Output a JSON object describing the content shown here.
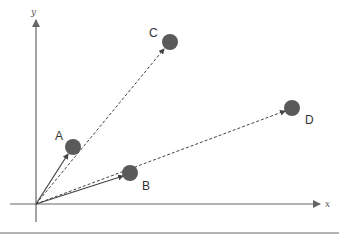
{
  "diagram": {
    "axes": {
      "x_label": "x",
      "y_label": "y",
      "color": "#666666"
    },
    "points": [
      {
        "label": "A",
        "vector": "solid"
      },
      {
        "label": "B",
        "vector": "solid"
      },
      {
        "label": "C",
        "vector": "dashed"
      },
      {
        "label": "D",
        "vector": "dashed"
      }
    ],
    "colors": {
      "point_fill": "#5a5a5a",
      "arrow": "#444444",
      "rule": "#9a9a9a"
    }
  }
}
